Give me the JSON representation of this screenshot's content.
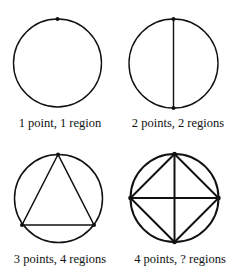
{
  "figure": {
    "stroke_color": "#111111",
    "panels": [
      {
        "label": "1 point, 1 region",
        "points": 1,
        "regions": "1"
      },
      {
        "label": "2 points, 2 regions",
        "points": 2,
        "regions": "2"
      },
      {
        "label": "3 points, 4 regions",
        "points": 3,
        "regions": "4"
      },
      {
        "label": "4 points, ? regions",
        "points": 4,
        "regions": "?"
      }
    ]
  }
}
